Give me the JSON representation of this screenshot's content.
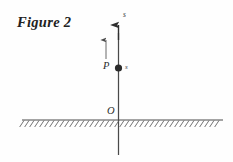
{
  "figure": {
    "title": "Figure 2",
    "background_color": "#fefefe",
    "ink_color": "#3a3a3a",
    "labels": {
      "axis_top": "s",
      "point": "P",
      "point_sub": "s",
      "origin": "O"
    },
    "elements": {
      "vertical_axis_name": "vertical-axis-arrow",
      "ground_line_name": "ground-line",
      "hatching_name": "ground-hatching",
      "displacement_arrow_name": "displacement-arrow",
      "point_marker_name": "point-marker-p"
    },
    "geometry": {
      "axis_x": 118.5,
      "axis_top_y": 25,
      "axis_bottom_y": 155,
      "ground_y": 120,
      "ground_x_start": 22,
      "ground_x_end": 223,
      "point_p_y": 68,
      "small_arrow_x": 106,
      "small_arrow_top_y": 40,
      "small_arrow_bottom_y": 59,
      "hatch_count": 40,
      "hatch_spacing": 5,
      "hatch_length": 7
    }
  }
}
